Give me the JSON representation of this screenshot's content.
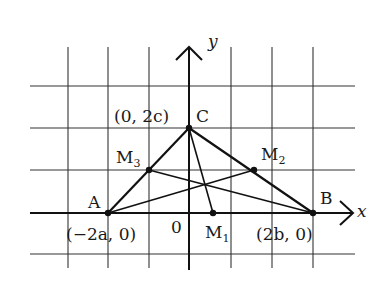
{
  "diagram": {
    "type": "coordinate-geometry",
    "axes": {
      "x_label": "x",
      "y_label": "y",
      "origin_label": "0"
    },
    "points": {
      "A": {
        "label": "A",
        "coords_label": "(−2a, 0)"
      },
      "B": {
        "label": "B",
        "coords_label": "(2b, 0)"
      },
      "C": {
        "label": "C",
        "coords_label": "(0, 2c)"
      },
      "M1": {
        "label": "M",
        "subscript": "1"
      },
      "M2": {
        "label": "M",
        "subscript": "2"
      },
      "M3": {
        "label": "M",
        "subscript": "3"
      }
    },
    "colors": {
      "ink": "#1a1a1a",
      "grid": "#333333",
      "background": "#ffffff"
    }
  }
}
